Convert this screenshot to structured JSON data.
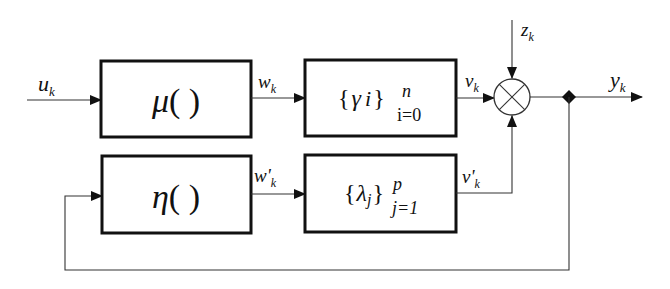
{
  "diagram": {
    "blocks": {
      "mu": {
        "func": "μ",
        "parens": "( )"
      },
      "gamma": {
        "open": "{",
        "sym": "γ",
        "idx": "i",
        "close": "}",
        "sup": "n",
        "sub": "i=0"
      },
      "eta": {
        "func": "η",
        "parens": "( )"
      },
      "lambda": {
        "open": "{",
        "sym": "λ",
        "idx": "j",
        "close": "}",
        "sup": "p",
        "sub": "j=1"
      }
    },
    "signals": {
      "u": {
        "base": "u",
        "sub": "k"
      },
      "w": {
        "base": "w",
        "sub": "k"
      },
      "v": {
        "base": "v",
        "sub": "k"
      },
      "w_prime": {
        "base": "w'",
        "sub": "k"
      },
      "v_prime": {
        "base": "v'",
        "sub": "k"
      },
      "z": {
        "base": "z",
        "sub": "k"
      },
      "y": {
        "base": "y",
        "sub": "k"
      }
    },
    "junction": {
      "type": "multiplier",
      "symbol": "⊗"
    },
    "colors": {
      "line": "#333333",
      "box": "#111111",
      "background": "#ffffff"
    }
  }
}
